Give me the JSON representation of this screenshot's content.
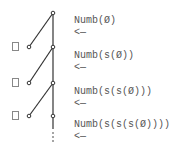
{
  "diagram": {
    "rows": [
      {
        "term": "Numb(Ø)",
        "arrow": "<—",
        "has_checkbox": false
      },
      {
        "term": "Numb(s(Ø))",
        "arrow": "<—",
        "has_checkbox": true
      },
      {
        "term": "Numb(s(s(Ø)))",
        "arrow": "<—",
        "has_checkbox": true
      },
      {
        "term": "Numb(s(s(s(Ø))))",
        "arrow": "<—",
        "has_checkbox": true
      }
    ],
    "continuation": "⋮",
    "colors": {
      "line": "#333333",
      "text": "#555555",
      "checkbox": "#888888"
    }
  }
}
